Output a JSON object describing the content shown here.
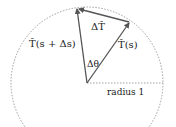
{
  "diagram": {
    "labels": {
      "t_next": "T̂(s + Δs)",
      "t_curr": "T̂(s)",
      "delta_t": "ΔT̂",
      "delta_theta": "Δθ",
      "radius": "radius 1"
    },
    "colors": {
      "arrow": "#666666",
      "circle": "#888888",
      "text": "#222222"
    }
  }
}
